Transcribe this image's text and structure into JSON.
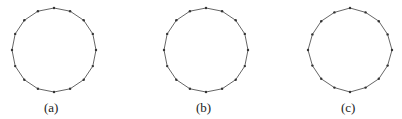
{
  "figure": {
    "panels": [
      {
        "label": "(a)",
        "shape": "polygon-16",
        "center": [
          54,
          50
        ],
        "radius": 42,
        "vertex_count": 16,
        "rotation_deg": 0,
        "caption_pos": [
          44,
          112
        ]
      },
      {
        "label": "(b)",
        "shape": "polygon-16",
        "center": [
          206,
          50
        ],
        "radius": 42,
        "vertex_count": 16,
        "rotation_deg": 0,
        "caption_pos": [
          196,
          112
        ]
      },
      {
        "label": "(c)",
        "shape": "polygon-irregular",
        "center": [
          350,
          50
        ],
        "radius": 42,
        "vertex_count": 16,
        "rotation_deg": 0,
        "caption_pos": [
          341,
          112
        ]
      }
    ],
    "colors": {
      "edge": "#555555",
      "vertex": "#333333",
      "background": "#ffffff"
    }
  }
}
